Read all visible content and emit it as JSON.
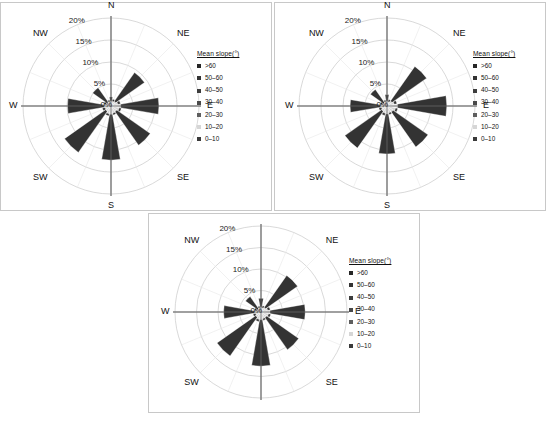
{
  "figure": {
    "background": "#ffffff",
    "panel_border": "#c8c8c8"
  },
  "legend": {
    "title": "Mean slope(°)",
    "items": [
      {
        "label": ">60",
        "color": "#262626"
      },
      {
        "label": "50–60",
        "color": "#333333"
      },
      {
        "label": "40–50",
        "color": "#3d3d3d"
      },
      {
        "label": "30–40",
        "color": "#4a4a4a"
      },
      {
        "label": "20–30",
        "color": "#5e5e5e"
      },
      {
        "label": "10–20",
        "color": "#d6d6d6"
      },
      {
        "label": "0–10",
        "color": "#3a3a3a"
      }
    ]
  },
  "axis": {
    "tick_labels": [
      "0%",
      "5%",
      "10%",
      "15%",
      "20%"
    ],
    "tick_values": [
      0,
      5,
      10,
      15,
      20
    ],
    "compass_labels": [
      "N",
      "NE",
      "E",
      "SE",
      "S",
      "SW",
      "W",
      "NW"
    ],
    "grid_color": "#c9c9c9",
    "spoke_color": "#8c8c8c"
  },
  "chart_data": [
    {
      "type": "pie",
      "subtype": "wind-rose-stacked-polar-bar",
      "title": "",
      "panel_id": "panel-1",
      "rlabel": "%",
      "rlim": [
        0,
        20
      ],
      "rticks": [
        0,
        5,
        10,
        15,
        20
      ],
      "rtick_labels": [
        "0%",
        "5%",
        "10%",
        "15%",
        "20%"
      ],
      "grid": true,
      "legend_position": "right",
      "legend_title": "Mean slope(°)",
      "categories": [
        "N",
        "NNE",
        "NE",
        "ENE",
        "E",
        "ESE",
        "SE",
        "SSE",
        "S",
        "SSW",
        "SW",
        "WSW",
        "W",
        "WNW",
        "NW",
        "NNW"
      ],
      "series": [
        {
          "name": "10–20",
          "color": "#d6d6d6",
          "values": [
            1.0,
            1.1,
            1.3,
            1.6,
            2.2,
            1.9,
            1.6,
            1.7,
            1.9,
            1.8,
            1.5,
            1.4,
            1.6,
            1.2,
            1.1,
            1.0
          ]
        },
        {
          "name": "20–60+",
          "color": "#333333",
          "values": [
            1.1,
            0.5,
            8.0,
            0.6,
            8.7,
            0.5,
            9.3,
            0.4,
            10.4,
            0.5,
            11.4,
            0.6,
            8.3,
            0.5,
            4.0,
            0.4
          ]
        }
      ],
      "totals_pct": [
        2.1,
        1.6,
        9.3,
        2.2,
        10.9,
        2.4,
        10.9,
        2.1,
        12.3,
        2.3,
        12.9,
        2.0,
        9.9,
        1.7,
        5.1,
        1.4
      ],
      "notes": "Eight principal-direction petals dominate; intercardinal minor spokes are short light-gray slivers."
    },
    {
      "type": "pie",
      "subtype": "wind-rose-stacked-polar-bar",
      "title": "",
      "panel_id": "panel-2",
      "rlabel": "%",
      "rlim": [
        0,
        20
      ],
      "rticks": [
        0,
        5,
        10,
        15,
        20
      ],
      "rtick_labels": [
        "0%",
        "5%",
        "10%",
        "15%",
        "20%"
      ],
      "grid": true,
      "legend_position": "right",
      "legend_title": "Mean slope(°)",
      "categories": [
        "N",
        "NNE",
        "NE",
        "ENE",
        "E",
        "ESE",
        "SE",
        "SSE",
        "S",
        "SSW",
        "SW",
        "WSW",
        "W",
        "WNW",
        "NW",
        "NNW"
      ],
      "series": [
        {
          "name": "10–20",
          "color": "#d6d6d6",
          "values": [
            1.0,
            1.0,
            1.4,
            1.7,
            2.4,
            2.0,
            1.7,
            1.6,
            1.8,
            1.7,
            1.5,
            1.3,
            1.5,
            1.1,
            1.0,
            1.0
          ]
        },
        {
          "name": "20–60+",
          "color": "#333333",
          "values": [
            1.6,
            0.5,
            9.6,
            0.6,
            11.2,
            0.5,
            9.7,
            0.4,
            9.1,
            0.5,
            10.2,
            0.6,
            6.9,
            0.5,
            3.6,
            0.4
          ]
        }
      ],
      "totals_pct": [
        2.6,
        1.5,
        11.0,
        2.3,
        13.6,
        2.5,
        11.4,
        2.0,
        10.9,
        2.2,
        11.7,
        1.9,
        8.4,
        1.6,
        4.6,
        1.4
      ],
      "notes": "Similar distribution to panel 1 with a stronger E petal."
    },
    {
      "type": "pie",
      "subtype": "wind-rose-stacked-polar-bar",
      "title": "",
      "panel_id": "panel-3",
      "rlabel": "%",
      "rlim": [
        0,
        20
      ],
      "rticks": [
        0,
        5,
        10,
        15,
        20
      ],
      "rtick_labels": [
        "0%",
        "5%",
        "10%",
        "15%",
        "20%"
      ],
      "grid": true,
      "legend_position": "right",
      "legend_title": "Mean slope(°)",
      "categories": [
        "N",
        "NNE",
        "NE",
        "ENE",
        "E",
        "ESE",
        "SE",
        "SSE",
        "S",
        "SSW",
        "SW",
        "WSW",
        "W",
        "WNW",
        "NW",
        "NNW"
      ],
      "series": [
        {
          "name": "10–20",
          "color": "#d6d6d6",
          "values": [
            1.0,
            1.0,
            1.3,
            1.6,
            2.1,
            1.8,
            1.6,
            1.6,
            1.8,
            1.8,
            1.5,
            1.3,
            1.5,
            1.1,
            1.0,
            1.0
          ]
        },
        {
          "name": "20–60+",
          "color": "#333333",
          "values": [
            2.2,
            0.5,
            9.1,
            0.6,
            8.2,
            0.5,
            9.1,
            0.4,
            10.8,
            0.5,
            11.0,
            0.6,
            7.2,
            0.5,
            3.4,
            0.4
          ]
        }
      ],
      "totals_pct": [
        3.2,
        1.5,
        10.4,
        2.2,
        10.3,
        2.3,
        10.7,
        2.0,
        12.6,
        2.3,
        12.5,
        1.9,
        8.7,
        1.6,
        4.4,
        1.4
      ],
      "notes": "N petal slightly longer than in panels 1 and 2; S and SW petals longest."
    }
  ],
  "panels": [
    {
      "id": "panel-1",
      "show_n": true,
      "show_s": true
    },
    {
      "id": "panel-2",
      "show_n": true,
      "show_s": true
    },
    {
      "id": "panel-3",
      "show_n": false,
      "show_s": false
    }
  ]
}
